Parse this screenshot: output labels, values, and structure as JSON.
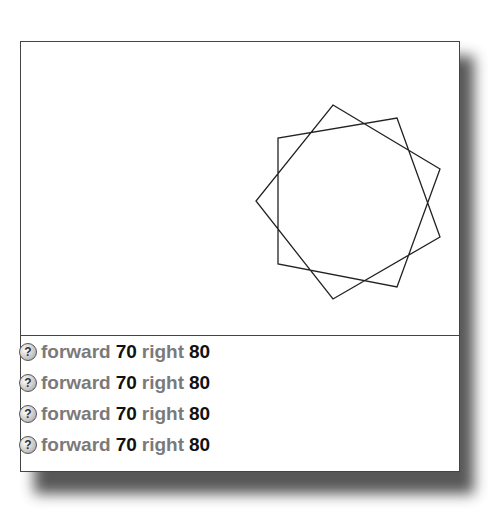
{
  "canvas": {
    "shape": "turtle-star-polygon",
    "stroke_color": "#222222",
    "vertices": [
      [
        333,
        105
      ],
      [
        397,
        118
      ],
      [
        440,
        169
      ],
      [
        440,
        237
      ],
      [
        397,
        287
      ],
      [
        333,
        299
      ],
      [
        278,
        264
      ],
      [
        256,
        201
      ],
      [
        278,
        138
      ]
    ]
  },
  "listener": {
    "rows": [
      {
        "icon": "help-question-icon",
        "cmd1": "forward",
        "arg1": "70",
        "cmd2": "right",
        "arg2": "80"
      },
      {
        "icon": "help-question-icon",
        "cmd1": "forward",
        "arg1": "70",
        "cmd2": "right",
        "arg2": "80"
      },
      {
        "icon": "help-question-icon",
        "cmd1": "forward",
        "arg1": "70",
        "cmd2": "right",
        "arg2": "80"
      },
      {
        "icon": "help-question-icon",
        "cmd1": "forward",
        "arg1": "70",
        "cmd2": "right",
        "arg2": "80"
      }
    ],
    "icon_glyph": "?"
  }
}
